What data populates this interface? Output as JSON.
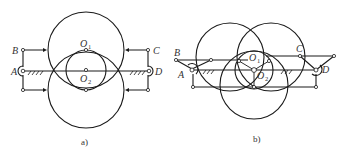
{
  "figure_a": {
    "caption": "a)",
    "labels": {
      "B": "B",
      "C": "C",
      "A": "A",
      "D": "D",
      "O1": "O",
      "O1_sub": "1",
      "O2": "O",
      "O2_sub": "2"
    }
  },
  "figure_b": {
    "caption": "b)",
    "labels": {
      "B": "B",
      "C": "C",
      "A": "A",
      "D": "D",
      "O1": "O",
      "O1_sub": "1",
      "O2": "O",
      "O2_sub": "2"
    }
  },
  "colors": {
    "stroke": "#1a1a1a",
    "text": "#333333",
    "background": "#ffffff"
  }
}
